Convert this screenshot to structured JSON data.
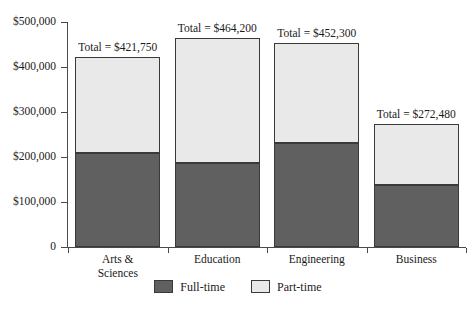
{
  "chart_data": {
    "type": "bar",
    "subtype": "stacked-bar",
    "title": "",
    "xlabel": "",
    "ylabel": "",
    "ylim": [
      0,
      500000
    ],
    "grid": false,
    "legend_position": "bottom-center",
    "categories": [
      "Arts & Sciences",
      "Education",
      "Engineering",
      "Business"
    ],
    "ytick_labels": [
      "$500,000",
      "$400,000",
      "$300,000",
      "$200,000",
      "$100,000",
      "0"
    ],
    "ytick_values": [
      500000,
      400000,
      300000,
      200000,
      100000,
      0
    ],
    "series": [
      {
        "name": "Full-time",
        "color": "#606060",
        "values": [
          210000,
          186000,
          232000,
          138000
        ]
      },
      {
        "name": "Part-time",
        "color": "#e9e9e9",
        "values": [
          211750,
          278200,
          220300,
          134480
        ]
      }
    ],
    "totals": [
      421750,
      464200,
      452300,
      272480
    ],
    "total_labels": [
      "Total = $421,750",
      "Total = $464,200",
      "Total = $452,300",
      "Total = $272,480"
    ]
  },
  "legend": {
    "items": [
      {
        "label": "Full-time",
        "color": "#606060"
      },
      {
        "label": "Part-time",
        "color": "#e9e9e9"
      }
    ]
  },
  "colors": {
    "full_time": "#606060",
    "part_time": "#e9e9e9",
    "outline": "#3a3a3a",
    "axis": "#4a4a4a",
    "text": "#1a1a1a",
    "background": "#ffffff"
  }
}
